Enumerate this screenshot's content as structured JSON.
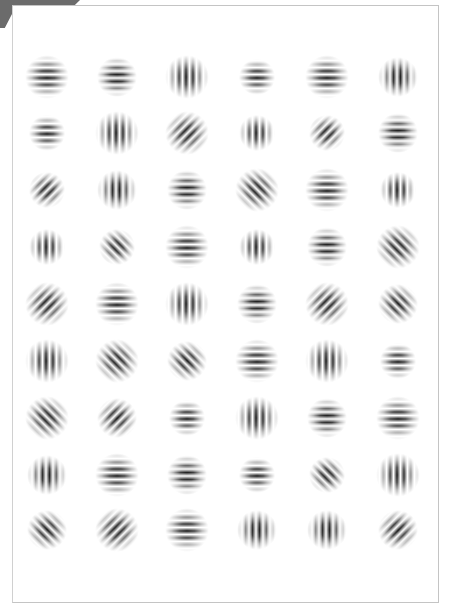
{
  "stimulus": {
    "description": "Grid of Gabor patches",
    "rows": 9,
    "cols": 6,
    "colors": {
      "bar": "#111111",
      "background": "#ffffff",
      "frame": "#c4c4c4",
      "tab": "#6b6b6b"
    },
    "col_x": [
      47,
      117,
      187,
      257,
      327,
      398
    ],
    "row_y": [
      77,
      133,
      190,
      247,
      304,
      361,
      418,
      475,
      530
    ],
    "patches": [
      [
        {
          "o": "horizontal",
          "bars": 4
        },
        {
          "o": "horizontal",
          "bars": 3
        },
        {
          "o": "vertical",
          "bars": 4
        },
        {
          "o": "horizontal",
          "bars": 2
        },
        {
          "o": "horizontal",
          "bars": 4
        },
        {
          "o": "vertical",
          "bars": 3
        }
      ],
      [
        {
          "o": "horizontal",
          "bars": 2
        },
        {
          "o": "vertical",
          "bars": 4
        },
        {
          "o": "diag-right",
          "bars": 4
        },
        {
          "o": "vertical",
          "bars": 2
        },
        {
          "o": "diag-right",
          "bars": 2
        },
        {
          "o": "horizontal",
          "bars": 3
        }
      ],
      [
        {
          "o": "diag-right",
          "bars": 2
        },
        {
          "o": "vertical",
          "bars": 3
        },
        {
          "o": "horizontal",
          "bars": 3
        },
        {
          "o": "diag-left",
          "bars": 4
        },
        {
          "o": "horizontal",
          "bars": 4
        },
        {
          "o": "vertical",
          "bars": 2
        }
      ],
      [
        {
          "o": "vertical",
          "bars": 2
        },
        {
          "o": "diag-left",
          "bars": 2
        },
        {
          "o": "horizontal",
          "bars": 4
        },
        {
          "o": "vertical",
          "bars": 2
        },
        {
          "o": "horizontal",
          "bars": 3
        },
        {
          "o": "diag-left",
          "bars": 4
        }
      ],
      [
        {
          "o": "diag-right",
          "bars": 4
        },
        {
          "o": "horizontal",
          "bars": 4
        },
        {
          "o": "vertical",
          "bars": 4
        },
        {
          "o": "horizontal",
          "bars": 3
        },
        {
          "o": "diag-right",
          "bars": 4
        },
        {
          "o": "diag-left",
          "bars": 3
        }
      ],
      [
        {
          "o": "vertical",
          "bars": 4
        },
        {
          "o": "diag-left",
          "bars": 4
        },
        {
          "o": "diag-left",
          "bars": 3
        },
        {
          "o": "horizontal",
          "bars": 4
        },
        {
          "o": "vertical",
          "bars": 4
        },
        {
          "o": "horizontal",
          "bars": 2
        }
      ],
      [
        {
          "o": "diag-left",
          "bars": 4
        },
        {
          "o": "diag-right",
          "bars": 3
        },
        {
          "o": "horizontal",
          "bars": 2
        },
        {
          "o": "vertical",
          "bars": 4
        },
        {
          "o": "horizontal",
          "bars": 3
        },
        {
          "o": "horizontal",
          "bars": 4
        }
      ],
      [
        {
          "o": "vertical",
          "bars": 3
        },
        {
          "o": "horizontal",
          "bars": 4
        },
        {
          "o": "horizontal",
          "bars": 3
        },
        {
          "o": "horizontal",
          "bars": 2
        },
        {
          "o": "diag-left",
          "bars": 2
        },
        {
          "o": "vertical",
          "bars": 4
        }
      ],
      [
        {
          "o": "diag-left",
          "bars": 3
        },
        {
          "o": "diag-right",
          "bars": 4
        },
        {
          "o": "horizontal",
          "bars": 4
        },
        {
          "o": "vertical",
          "bars": 3
        },
        {
          "o": "vertical",
          "bars": 3
        },
        {
          "o": "diag-right",
          "bars": 3
        }
      ]
    ]
  }
}
